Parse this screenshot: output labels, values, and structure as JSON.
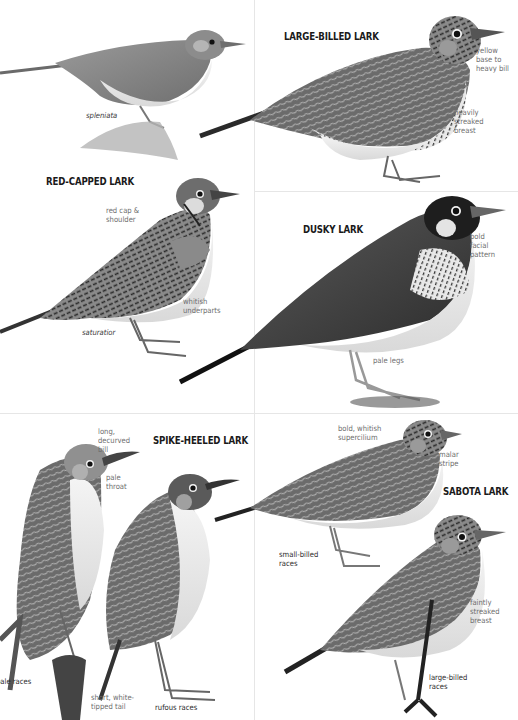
{
  "plate": {
    "species": [
      {
        "id": "spleniata-top-left",
        "title": null,
        "races": [
          {
            "label": "spleniata",
            "style": "italic"
          }
        ],
        "notes": []
      },
      {
        "id": "large-billed-lark",
        "title": "LARGE-BILLED LARK",
        "races": [],
        "notes": [
          "yellow\nbase to\nheavy bill",
          "heavily\nstreaked\nbreast"
        ]
      },
      {
        "id": "red-capped-lark",
        "title": "RED-CAPPED LARK",
        "races": [
          {
            "label": "saturatior",
            "style": "italic"
          }
        ],
        "notes": [
          "red cap &\nshoulder",
          "whitish\nunderparts"
        ]
      },
      {
        "id": "dusky-lark",
        "title": "DUSKY LARK",
        "races": [],
        "notes": [
          "bold\nfacial\npattern",
          "pale legs"
        ]
      },
      {
        "id": "spike-heeled-lark",
        "title": "SPIKE-HEELED LARK",
        "races": [
          {
            "label": "pale races",
            "style": "normal"
          },
          {
            "label": "rufous races",
            "style": "normal"
          }
        ],
        "notes": [
          "long,\ndecurved\nbill",
          "pale\nthroat",
          "short, white-\ntipped tail"
        ]
      },
      {
        "id": "sabota-lark",
        "title": "SABOTA LARK",
        "races": [
          {
            "label": "small-billed\nraces",
            "style": "normal"
          },
          {
            "label": "large-billed\nraces",
            "style": "normal"
          }
        ],
        "notes": [
          "bold, whitish\nsupercilium",
          "malar\nstripe",
          "faintly\nstreaked\nbreast"
        ]
      }
    ]
  },
  "colors": {
    "title_text": "#1a1a1a",
    "note_text": "#6e6e6e",
    "race_text": "#2a2a2a",
    "divider": "#e6e6e6"
  }
}
